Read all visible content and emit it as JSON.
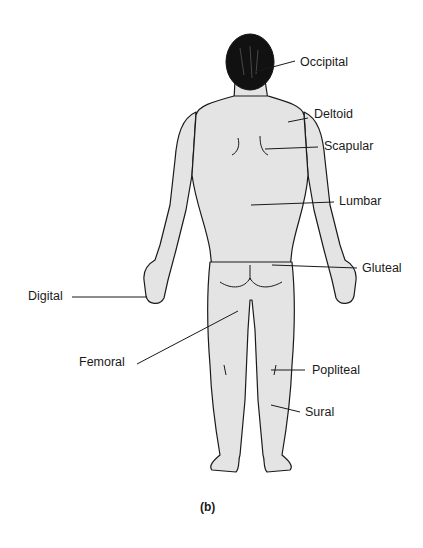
{
  "figure": {
    "caption": "(b)",
    "labels": {
      "occipital": "Occipital",
      "deltoid": "Deltoid",
      "scapular": "Scapular",
      "lumbar": "Lumbar",
      "gluteal": "Gluteal",
      "digital": "Digital",
      "femoral": "Femoral",
      "popliteal": "Popliteal",
      "sural": "Sural"
    }
  }
}
